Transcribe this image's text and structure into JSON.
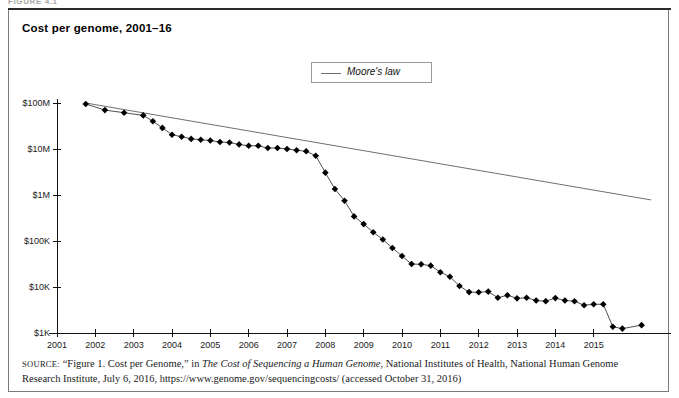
{
  "figure_header": "FIGURE 4.1",
  "chart_title": "Cost per genome, 2001–16",
  "legend": {
    "label": "Moore's law",
    "swatch_color": "#6f6f6f"
  },
  "source": {
    "prefix": "SOURCE:",
    "part1": " “Figure 1. Cost per Genome,” in ",
    "italic1": "The Cost of Sequencing a Human Genome",
    "part2": ", National Institutes of Health, National Human Genome Research Institute, July 6, 2016, https://www.genome.gov/sequencingcosts/ (accessed October 31, 2016)"
  },
  "chart_data": {
    "type": "line",
    "title": "Cost per genome, 2001–16",
    "xlabel": "",
    "ylabel": "",
    "yscale": "log",
    "ylim": [
      1000,
      100000000
    ],
    "xlim": [
      2001.0,
      2016.6
    ],
    "grid": false,
    "legend_position": "top-center",
    "ytick_labels": [
      "$100M",
      "$10M",
      "$1M",
      "$100K",
      "$10K",
      "$1K"
    ],
    "ytick_values": [
      100000000,
      10000000,
      1000000,
      100000,
      10000,
      1000
    ],
    "xtick_labels": [
      "2001",
      "2002",
      "2003",
      "2004",
      "2005",
      "2006",
      "2007",
      "2008",
      "2009",
      "2010",
      "2011",
      "2012",
      "2013",
      "2014",
      "2015"
    ],
    "xtick_values": [
      2001,
      2002,
      2003,
      2004,
      2005,
      2006,
      2007,
      2008,
      2009,
      2010,
      2011,
      2012,
      2013,
      2014,
      2015
    ],
    "series": [
      {
        "name": "Cost per genome",
        "marker": "diamond",
        "color": "#000000",
        "x": [
          2001.75,
          2002.25,
          2002.75,
          2003.25,
          2003.5,
          2003.75,
          2004.0,
          2004.25,
          2004.5,
          2004.75,
          2005.0,
          2005.25,
          2005.5,
          2005.75,
          2006.0,
          2006.25,
          2006.5,
          2006.75,
          2007.0,
          2007.25,
          2007.5,
          2007.75,
          2008.0,
          2008.25,
          2008.5,
          2008.75,
          2009.0,
          2009.25,
          2009.5,
          2009.75,
          2010.0,
          2010.25,
          2010.5,
          2010.75,
          2011.0,
          2011.25,
          2011.5,
          2011.75,
          2012.0,
          2012.25,
          2012.5,
          2012.75,
          2013.0,
          2013.25,
          2013.5,
          2013.75,
          2014.0,
          2014.25,
          2014.5,
          2014.75,
          2015.0,
          2015.25,
          2015.5,
          2015.75,
          2016.25
        ],
        "y": [
          95263072,
          70175437,
          61448422,
          53751684,
          40157554,
          28780376,
          20442576,
          18519312,
          16595496,
          15930338,
          15266829,
          14174924,
          13801124,
          12585521,
          11732535,
          11732535,
          10474556,
          10497396,
          10000000,
          9408739,
          8925033,
          7147571,
          3063820,
          1352982,
          752080,
          342502,
          232735,
          154714,
          108065,
          70333,
          47079,
          31512,
          31125,
          29092,
          20963,
          16712,
          10497,
          7743,
          7666,
          7950,
          5826,
          6618,
          5671,
          5826,
          5096,
          4920,
          5731,
          5096,
          4905,
          4008,
          4211,
          4211,
          1363,
          1245,
          1482
        ]
      },
      {
        "name": "Moore's law",
        "marker": "none",
        "color": "#6f6f6f",
        "x": [
          2001.75,
          2016.5
        ],
        "y": [
          100000000,
          780000
        ]
      }
    ]
  }
}
